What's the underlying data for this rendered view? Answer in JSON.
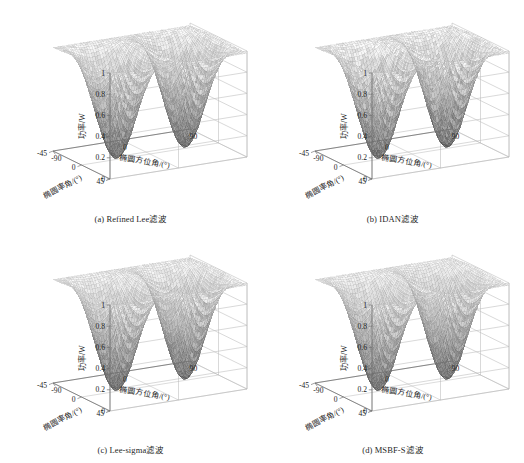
{
  "figure": {
    "title_present": false,
    "panel_count": 4,
    "background_color": "#ffffff",
    "line_color": "#8c8c8c",
    "text_color": "#222222"
  },
  "axes_common": {
    "z_label": "功率/W",
    "z_ticks": [
      "0",
      "0.2",
      "0.4",
      "0.6",
      "0.8",
      "1"
    ],
    "z_values": [
      0,
      0.2,
      0.4,
      0.6,
      0.8,
      1
    ],
    "z_range": [
      0,
      1
    ],
    "x_label": "椭圆率角/(°)",
    "x_ticks": [
      "45",
      "0",
      "-45"
    ],
    "x_values": [
      45,
      0,
      -45
    ],
    "x_range": [
      -45,
      45
    ],
    "y_label": "椭圆方位角/(°)",
    "y_ticks": [
      "-90",
      "0",
      "90"
    ],
    "y_values": [
      -90,
      0,
      90
    ],
    "y_range": [
      -90,
      90
    ]
  },
  "panels": [
    {
      "id": "a",
      "caption": "(a) Refined Lee滤波",
      "method": "Refined Lee",
      "position": "top-left"
    },
    {
      "id": "b",
      "caption": "(b) IDAN滤波",
      "method": "IDAN",
      "position": "top-right"
    },
    {
      "id": "c",
      "caption": "(c) Lee-sigma滤波",
      "method": "Lee-sigma",
      "position": "bottom-left"
    },
    {
      "id": "d",
      "caption": "(d) MSBF-S滤波",
      "method": "MSBF-S",
      "position": "bottom-right"
    }
  ],
  "chart_data": {
    "type": "surface",
    "title": "",
    "subtitle": "",
    "xlabel": "椭圆率角/(°)",
    "ylabel": "椭圆方位角/(°)",
    "zlabel": "功率/W",
    "xlim": [
      -45,
      45
    ],
    "ylim": [
      -90,
      90
    ],
    "zlim": [
      0,
      1
    ],
    "xticks": [
      45,
      0,
      -45
    ],
    "yticks": [
      -90,
      0,
      90
    ],
    "zticks": [
      0,
      0.2,
      0.4,
      0.6,
      0.8,
      1
    ],
    "grid": true,
    "legend": "none",
    "colormap": "gray",
    "render_style": "mesh-dotted",
    "series": [
      {
        "name": "(a) Refined Lee滤波",
        "description": "Polarization signature surface: co-pol response with high ridges along chi = ±45 deg edges, two deep nulls near psi = -45 and psi = +45 at chi = 0, central saddle ridge reaching about 0.55",
        "z_peak": 1.0,
        "z_min": 0.0,
        "ridge_level": 0.92,
        "saddle_level": 0.55,
        "null_count": 3
      },
      {
        "name": "(b) IDAN滤波",
        "description": "Polarization signature surface with slightly rougher texture, same global shape, ridges near 1.0 and nulls reaching 0",
        "z_peak": 1.0,
        "z_min": 0.0,
        "ridge_level": 0.93,
        "saddle_level": 0.56,
        "null_count": 3
      },
      {
        "name": "(c) Lee-sigma滤波",
        "description": "Polarization signature surface, smooth ridges near 1.0 with well-defined nulls at 0",
        "z_peak": 1.0,
        "z_min": 0.0,
        "ridge_level": 0.94,
        "saddle_level": 0.55,
        "null_count": 3
      },
      {
        "name": "(d) MSBF-S滤波",
        "description": "Polarization signature surface, smoothest ridges near 1.0 with sharply defined nulls at 0",
        "z_peak": 1.0,
        "z_min": 0.0,
        "ridge_level": 0.95,
        "saddle_level": 0.57,
        "null_count": 3
      }
    ]
  }
}
